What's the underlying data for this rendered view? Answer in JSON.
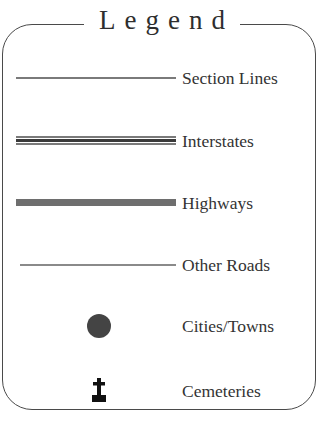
{
  "legend": {
    "title": "Legend",
    "items": [
      {
        "label": "Section Lines",
        "symbol": "thin-line"
      },
      {
        "label": "Interstates",
        "symbol": "double-line"
      },
      {
        "label": "Highways",
        "symbol": "thick-line"
      },
      {
        "label": "Other Roads",
        "symbol": "hairline"
      },
      {
        "label": "Cities/Towns",
        "symbol": "filled-circle"
      },
      {
        "label": "Cemeteries",
        "symbol": "cross-headstone"
      }
    ]
  },
  "colors": {
    "frame": "#4a4a4a",
    "text": "#333333",
    "highway": "#6e6e6e",
    "city": "#444444",
    "cemetery": "#111111"
  }
}
